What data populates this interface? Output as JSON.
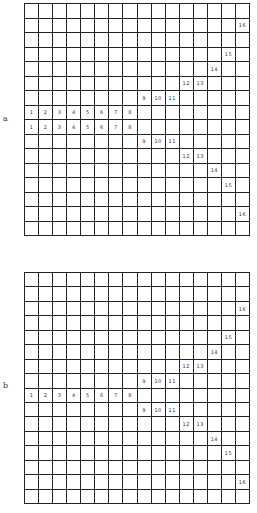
{
  "figure": {
    "panels": [
      {
        "label": "a",
        "rows": 16,
        "cols": 16,
        "cells": [
          {
            "row": 2,
            "col": 16,
            "value": "16"
          },
          {
            "row": 4,
            "col": 15,
            "value": "15"
          },
          {
            "row": 5,
            "col": 14,
            "value": "14"
          },
          {
            "row": 6,
            "col": 12,
            "value": "12"
          },
          {
            "row": 6,
            "col": 13,
            "value": "13"
          },
          {
            "row": 7,
            "col": 9,
            "value": "9"
          },
          {
            "row": 7,
            "col": 10,
            "value": "10"
          },
          {
            "row": 7,
            "col": 11,
            "value": "11"
          },
          {
            "row": 8,
            "col": 1,
            "value": "1"
          },
          {
            "row": 8,
            "col": 2,
            "value": "2"
          },
          {
            "row": 8,
            "col": 3,
            "value": "3"
          },
          {
            "row": 8,
            "col": 4,
            "value": "4"
          },
          {
            "row": 8,
            "col": 5,
            "value": "5"
          },
          {
            "row": 8,
            "col": 6,
            "value": "6"
          },
          {
            "row": 8,
            "col": 7,
            "value": "7"
          },
          {
            "row": 8,
            "col": 8,
            "value": "8"
          },
          {
            "row": 9,
            "col": 1,
            "value": "1"
          },
          {
            "row": 9,
            "col": 2,
            "value": "2"
          },
          {
            "row": 9,
            "col": 3,
            "value": "3"
          },
          {
            "row": 9,
            "col": 4,
            "value": "4"
          },
          {
            "row": 9,
            "col": 5,
            "value": "5"
          },
          {
            "row": 9,
            "col": 6,
            "value": "6"
          },
          {
            "row": 9,
            "col": 7,
            "value": "7"
          },
          {
            "row": 9,
            "col": 8,
            "value": "8"
          },
          {
            "row": 10,
            "col": 9,
            "value": "9"
          },
          {
            "row": 10,
            "col": 10,
            "value": "10"
          },
          {
            "row": 10,
            "col": 11,
            "value": "11"
          },
          {
            "row": 11,
            "col": 12,
            "value": "12"
          },
          {
            "row": 11,
            "col": 13,
            "value": "13"
          },
          {
            "row": 12,
            "col": 14,
            "value": "14"
          },
          {
            "row": 13,
            "col": 15,
            "value": "15"
          },
          {
            "row": 15,
            "col": 16,
            "value": "16"
          }
        ]
      },
      {
        "label": "b",
        "rows": 16,
        "cols": 16,
        "cells": [
          {
            "row": 3,
            "col": 16,
            "value": "16"
          },
          {
            "row": 5,
            "col": 15,
            "value": "15"
          },
          {
            "row": 6,
            "col": 14,
            "value": "14"
          },
          {
            "row": 7,
            "col": 12,
            "value": "12"
          },
          {
            "row": 7,
            "col": 13,
            "value": "13"
          },
          {
            "row": 8,
            "col": 9,
            "value": "9"
          },
          {
            "row": 8,
            "col": 10,
            "value": "10"
          },
          {
            "row": 8,
            "col": 11,
            "value": "11"
          },
          {
            "row": 9,
            "col": 1,
            "value": "1"
          },
          {
            "row": 9,
            "col": 2,
            "value": "2"
          },
          {
            "row": 9,
            "col": 3,
            "value": "3"
          },
          {
            "row": 9,
            "col": 4,
            "value": "4"
          },
          {
            "row": 9,
            "col": 5,
            "value": "5"
          },
          {
            "row": 9,
            "col": 6,
            "value": "6"
          },
          {
            "row": 9,
            "col": 7,
            "value": "7"
          },
          {
            "row": 9,
            "col": 8,
            "value": "8"
          },
          {
            "row": 10,
            "col": 9,
            "value": "9"
          },
          {
            "row": 10,
            "col": 10,
            "value": "10"
          },
          {
            "row": 10,
            "col": 11,
            "value": "11"
          },
          {
            "row": 11,
            "col": 12,
            "value": "12"
          },
          {
            "row": 11,
            "col": 13,
            "value": "13"
          },
          {
            "row": 12,
            "col": 14,
            "value": "14"
          },
          {
            "row": 13,
            "col": 15,
            "value": "15"
          },
          {
            "row": 15,
            "col": 16,
            "value": "16"
          }
        ]
      }
    ]
  }
}
